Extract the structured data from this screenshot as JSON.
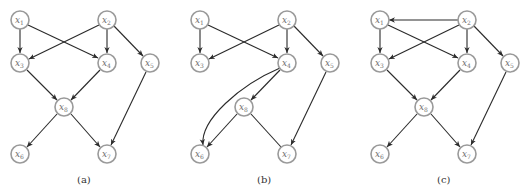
{
  "colors": {
    "node_stroke": "#9a9a9a",
    "edge": "#2a2a2a",
    "label": "#6e6e6e"
  },
  "node_labels": {
    "x1": {
      "base": "x",
      "sub": "1"
    },
    "x2": {
      "base": "x",
      "sub": "2"
    },
    "x3": {
      "base": "x",
      "sub": "3"
    },
    "x4": {
      "base": "x",
      "sub": "4"
    },
    "x5": {
      "base": "x",
      "sub": "5"
    },
    "x6": {
      "base": "x",
      "sub": "6"
    },
    "x7": {
      "base": "x",
      "sub": "7"
    },
    "x8": {
      "base": "x",
      "sub": "8"
    }
  },
  "graphs": [
    {
      "caption": "(a)",
      "edges": [
        [
          "x1",
          "x3",
          "directed"
        ],
        [
          "x1",
          "x4",
          "directed"
        ],
        [
          "x2",
          "x3",
          "directed"
        ],
        [
          "x2",
          "x4",
          "directed"
        ],
        [
          "x2",
          "x5",
          "directed"
        ],
        [
          "x3",
          "x8",
          "directed"
        ],
        [
          "x4",
          "x8",
          "directed"
        ],
        [
          "x8",
          "x6",
          "directed"
        ],
        [
          "x8",
          "x7",
          "directed"
        ],
        [
          "x5",
          "x7",
          "directed"
        ]
      ]
    },
    {
      "caption": "(b)",
      "edges": [
        [
          "x1",
          "x3",
          "directed"
        ],
        [
          "x1",
          "x4",
          "directed"
        ],
        [
          "x2",
          "x3",
          "directed"
        ],
        [
          "x2",
          "x4",
          "directed"
        ],
        [
          "x2",
          "x5",
          "directed"
        ],
        [
          "x4",
          "x8",
          "directed"
        ],
        [
          "x4",
          "x6",
          "directed-curved"
        ],
        [
          "x8",
          "x6",
          "directed"
        ],
        [
          "x8",
          "x7",
          "undirected"
        ],
        [
          "x5",
          "x7",
          "directed"
        ]
      ]
    },
    {
      "caption": "(c)",
      "edges": [
        [
          "x2",
          "x1",
          "directed"
        ],
        [
          "x1",
          "x3",
          "directed"
        ],
        [
          "x1",
          "x4",
          "directed"
        ],
        [
          "x2",
          "x3",
          "directed"
        ],
        [
          "x2",
          "x4",
          "directed"
        ],
        [
          "x2",
          "x5",
          "directed"
        ],
        [
          "x3",
          "x8",
          "directed"
        ],
        [
          "x4",
          "x8",
          "directed"
        ],
        [
          "x8",
          "x6",
          "directed"
        ],
        [
          "x8",
          "x7",
          "directed"
        ],
        [
          "x5",
          "x7",
          "directed"
        ]
      ]
    }
  ]
}
